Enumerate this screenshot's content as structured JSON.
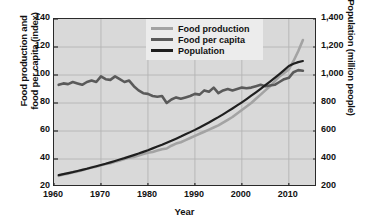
{
  "chart_data": {
    "type": "line",
    "title": "",
    "xlabel": "Year",
    "ylabel": "Food production and food per capita (index)",
    "ylabel_line1": "Food production and",
    "ylabel_line2": "food per capita (index)",
    "y2label": "Population (million people)",
    "xlim": [
      1960,
      2016
    ],
    "ylim": [
      20,
      140
    ],
    "y2lim": [
      200,
      1400
    ],
    "grid": true,
    "legend_position": "top-center",
    "xticks": [
      1960,
      1970,
      1980,
      1990,
      2000,
      2010
    ],
    "xtick_labels": [
      "1960",
      "1970",
      "1980",
      "1990",
      "2000",
      "2010"
    ],
    "yticks": [
      20,
      40,
      60,
      80,
      100,
      120,
      140
    ],
    "ytick_labels": [
      "20",
      "40",
      "60",
      "80",
      "100",
      "120",
      "140"
    ],
    "y2ticks": [
      200,
      400,
      600,
      800,
      1000,
      1200,
      1400
    ],
    "y2tick_labels": [
      "200",
      "400",
      "600",
      "800",
      "1,000",
      "1,200",
      "1,400"
    ],
    "colors": {
      "food_production": "#a3a3a3",
      "food_per_capita": "#5a5a5a",
      "population": "#1f1f1f",
      "plot_background": "#d9d9d9",
      "grid": "#b4b4b4",
      "axis": "#2a2a2a",
      "legend_background": "#ececec"
    },
    "series": [
      {
        "name": "Food production",
        "axis": "left",
        "color": "#a3a3a3",
        "x": [
          1961,
          1962,
          1963,
          1964,
          1965,
          1966,
          1967,
          1968,
          1969,
          1970,
          1971,
          1972,
          1973,
          1974,
          1975,
          1976,
          1977,
          1978,
          1979,
          1980,
          1981,
          1982,
          1983,
          1984,
          1985,
          1986,
          1987,
          1988,
          1989,
          1990,
          1991,
          1992,
          1993,
          1994,
          1995,
          1996,
          1997,
          1998,
          1999,
          2000,
          2001,
          2002,
          2003,
          2004,
          2005,
          2006,
          2007,
          2008,
          2009,
          2010,
          2011,
          2012,
          2013
        ],
        "values": [
          28,
          29,
          29.5,
          30.5,
          31,
          32,
          33,
          34,
          34.5,
          35.5,
          36.5,
          37,
          38,
          39,
          40,
          41,
          41.5,
          42.5,
          43.5,
          44.5,
          45,
          46,
          47,
          47.5,
          49.5,
          51,
          52,
          53.5,
          55,
          56.5,
          58,
          59.5,
          61,
          62.5,
          64,
          66,
          68,
          70,
          72.5,
          75,
          77.5,
          80,
          83,
          86,
          89,
          92,
          95.5,
          99,
          101.5,
          104,
          110,
          117,
          125
        ]
      },
      {
        "name": "Food per capita",
        "axis": "left",
        "color": "#5a5a5a",
        "x": [
          1961,
          1962,
          1963,
          1964,
          1965,
          1966,
          1967,
          1968,
          1969,
          1970,
          1971,
          1972,
          1973,
          1974,
          1975,
          1976,
          1977,
          1978,
          1979,
          1980,
          1981,
          1982,
          1983,
          1984,
          1985,
          1986,
          1987,
          1988,
          1989,
          1990,
          1991,
          1992,
          1993,
          1994,
          1995,
          1996,
          1997,
          1998,
          1999,
          2000,
          2001,
          2002,
          2003,
          2004,
          2005,
          2006,
          2007,
          2008,
          2009,
          2010,
          2011,
          2012,
          2013
        ],
        "values": [
          93,
          94,
          93.5,
          95,
          94,
          93,
          95,
          96,
          95,
          99,
          97,
          96.5,
          99,
          97,
          95,
          96,
          92,
          89,
          87,
          86.5,
          85,
          84.5,
          85,
          80,
          82.5,
          84,
          83,
          84,
          85,
          86.5,
          86,
          89,
          88,
          91,
          87,
          89,
          90,
          89,
          90,
          91,
          90.5,
          91,
          92,
          93,
          92,
          92.5,
          93,
          95,
          97,
          98,
          102,
          103.5,
          103
        ]
      },
      {
        "name": "Population",
        "axis": "right",
        "color": "#1f1f1f",
        "x": [
          1961,
          1962,
          1963,
          1964,
          1965,
          1966,
          1967,
          1968,
          1969,
          1970,
          1971,
          1972,
          1973,
          1974,
          1975,
          1976,
          1977,
          1978,
          1979,
          1980,
          1981,
          1982,
          1983,
          1984,
          1985,
          1986,
          1987,
          1988,
          1989,
          1990,
          1991,
          1992,
          1993,
          1994,
          1995,
          1996,
          1997,
          1998,
          1999,
          2000,
          2001,
          2002,
          2003,
          2004,
          2005,
          2006,
          2007,
          2008,
          2009,
          2010,
          2011,
          2012,
          2013
        ],
        "values": [
          285,
          292,
          299,
          306,
          314,
          322,
          330,
          339,
          348,
          357,
          366,
          376,
          386,
          396,
          406,
          417,
          428,
          439,
          451,
          463,
          476,
          489,
          502,
          516,
          530,
          545,
          560,
          576,
          592,
          608,
          625,
          643,
          661,
          680,
          699,
          719,
          740,
          761,
          783,
          805,
          828,
          852,
          876,
          901,
          927,
          953,
          980,
          1007,
          1035,
          1064,
          1080,
          1092,
          1100
        ]
      }
    ]
  },
  "legend": {
    "items": [
      {
        "label": "Food production",
        "color": "#a3a3a3"
      },
      {
        "label": "Food per capita",
        "color": "#5a5a5a"
      },
      {
        "label": "Population",
        "color": "#1f1f1f"
      }
    ]
  }
}
